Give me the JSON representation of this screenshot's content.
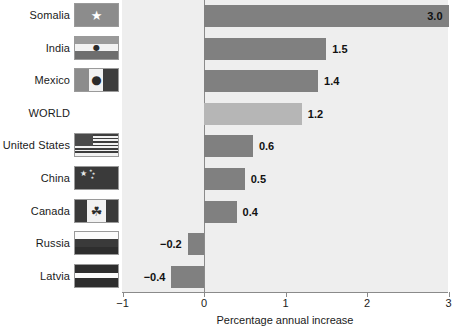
{
  "chart_data": {
    "type": "bar",
    "orientation": "horizontal",
    "title": "",
    "xlabel": "Percentage annual increase",
    "ylabel": "",
    "xlim": [
      -1,
      3
    ],
    "xticks": [
      "−1",
      "0",
      "1",
      "2",
      "3"
    ],
    "xtick_values": [
      -1,
      0,
      1,
      2,
      3
    ],
    "grid": false,
    "legend": "none",
    "categories": [
      "Somalia",
      "India",
      "Mexico",
      "WORLD",
      "United States",
      "China",
      "Canada",
      "Russia",
      "Latvia"
    ],
    "values": [
      3.0,
      1.5,
      1.4,
      1.2,
      0.6,
      0.5,
      0.4,
      -0.2,
      -0.4
    ],
    "value_labels": [
      "3.0",
      "1.5",
      "1.4",
      "1.2",
      "0.6",
      "0.5",
      "0.4",
      "−0.2",
      "−0.4"
    ],
    "highlight_category": "WORLD",
    "colors": {
      "bar": "#808080",
      "bar_highlight": "#b6b6b6",
      "plot_background": "#eeeeee",
      "axis": "#8a8a8a",
      "text": "#1a1a1a"
    },
    "rows": [
      {
        "label": "Somalia",
        "value": 3.0,
        "value_label": "3.0",
        "flag": "flag-somalia",
        "has_flag": true,
        "highlight": false
      },
      {
        "label": "India",
        "value": 1.5,
        "value_label": "1.5",
        "flag": "flag-india",
        "has_flag": true,
        "highlight": false
      },
      {
        "label": "Mexico",
        "value": 1.4,
        "value_label": "1.4",
        "flag": "flag-mexico",
        "has_flag": true,
        "highlight": false
      },
      {
        "label": "WORLD",
        "value": 1.2,
        "value_label": "1.2",
        "flag": "",
        "has_flag": false,
        "highlight": true
      },
      {
        "label": "United States",
        "value": 0.6,
        "value_label": "0.6",
        "flag": "flag-united-states",
        "has_flag": true,
        "highlight": false
      },
      {
        "label": "China",
        "value": 0.5,
        "value_label": "0.5",
        "flag": "flag-china",
        "has_flag": true,
        "highlight": false
      },
      {
        "label": "Canada",
        "value": 0.4,
        "value_label": "0.4",
        "flag": "flag-canada",
        "has_flag": true,
        "highlight": false
      },
      {
        "label": "Russia",
        "value": -0.2,
        "value_label": "−0.2",
        "flag": "flag-russia",
        "has_flag": true,
        "highlight": false
      },
      {
        "label": "Latvia",
        "value": -0.4,
        "value_label": "−0.4",
        "flag": "flag-latvia",
        "has_flag": true,
        "highlight": false
      }
    ]
  }
}
